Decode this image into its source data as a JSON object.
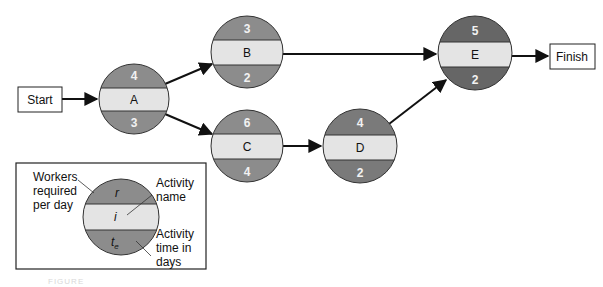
{
  "diagram": {
    "type": "activity-on-node network",
    "colors": {
      "segment_light": "#e4e4e4",
      "segment_mid": "#8c8c8c",
      "segment_dark": "#666666",
      "line": "#111111",
      "number_text": "#f2f2f2"
    },
    "start": {
      "label": "Start"
    },
    "finish": {
      "label": "Finish"
    },
    "nodes": {
      "A": {
        "name": "A",
        "workers": "4",
        "time": "3"
      },
      "B": {
        "name": "B",
        "workers": "3",
        "time": "2"
      },
      "C": {
        "name": "C",
        "workers": "6",
        "time": "4"
      },
      "D": {
        "name": "D",
        "workers": "4",
        "time": "2"
      },
      "E": {
        "name": "E",
        "workers": "5",
        "time": "2"
      }
    },
    "edges": [
      {
        "from": "Start",
        "to": "A"
      },
      {
        "from": "A",
        "to": "B"
      },
      {
        "from": "A",
        "to": "C"
      },
      {
        "from": "B",
        "to": "E"
      },
      {
        "from": "C",
        "to": "D"
      },
      {
        "from": "D",
        "to": "E"
      },
      {
        "from": "E",
        "to": "Finish"
      }
    ]
  },
  "legend": {
    "top_symbol": "r",
    "middle_symbol": "i",
    "bottom_symbol": "t",
    "bottom_symbol_sub": "e",
    "workers_label": [
      "Workers",
      "required",
      "per day"
    ],
    "name_label": [
      "Activity",
      "name"
    ],
    "time_label": [
      "Activity",
      "time in",
      "days"
    ]
  },
  "caption": "FIGURE"
}
